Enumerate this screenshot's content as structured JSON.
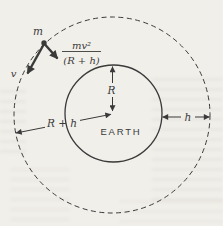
{
  "colors": {
    "ink": "#3a3a3a",
    "paper": "#f1efea"
  },
  "labels": {
    "mass": "m",
    "velocity": "v",
    "centripetal_numerator": "mv²",
    "centripetal_denominator": "(R + h)",
    "earth_radius": "R",
    "orbit_radius": "R + h",
    "altitude": "h",
    "earth": "EARTH"
  }
}
